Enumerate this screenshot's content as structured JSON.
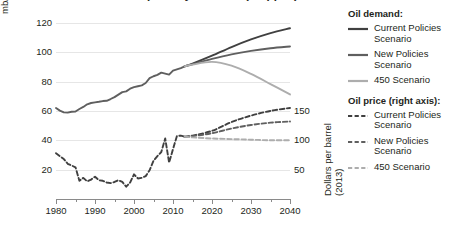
{
  "title": {
    "text": "World oil demand and price by scenario (cropped)",
    "note": "title row is cut off at the top edge of the screenshot"
  },
  "axes": {
    "left": {
      "label": "mb/d",
      "ticks": [
        20,
        40,
        60,
        80,
        100,
        120
      ],
      "min": 0,
      "max": 126
    },
    "right": {
      "label_line1": "Dollars per barrel",
      "label_line2": "(2013)",
      "ticks": [
        50,
        100,
        150
      ],
      "min": 0,
      "max": 315
    },
    "bottom": {
      "ticks": [
        1980,
        1990,
        2000,
        2010,
        2020,
        2030,
        2040
      ],
      "minor_ticks": [
        1985,
        1995,
        2005,
        2015,
        2025,
        2035
      ],
      "min": 1980,
      "max": 2040
    }
  },
  "legend": {
    "groups": [
      {
        "title": "Oil demand:",
        "items": [
          {
            "label": "Current Policies Scenario",
            "style": "solid",
            "color": "#404040"
          },
          {
            "label": "New Policies Scenario",
            "style": "solid",
            "color": "#5f5f5f"
          },
          {
            "label": "450 Scenario",
            "style": "solid",
            "color": "#adadad"
          }
        ]
      },
      {
        "title": "Oil price (right axis):",
        "items": [
          {
            "label": "Current Policies Scenario",
            "style": "dashed",
            "color": "#404040"
          },
          {
            "label": "New Policies Scenario",
            "style": "dashed",
            "color": "#5f5f5f"
          },
          {
            "label": "450 Scenario",
            "style": "dashed",
            "color": "#adadad"
          }
        ]
      }
    ]
  },
  "colors": {
    "current_policies": "#404040",
    "new_policies": "#5f5f5f",
    "scenario_450": "#adadad",
    "gridline": "#e6e6e6",
    "axis": "#8a8a8a",
    "text": "#231f20"
  },
  "chart_data": {
    "type": "line",
    "title": "World oil demand and price by scenario",
    "xlabel": "",
    "ylabel": "mb/d",
    "y2label": "Dollars per barrel (2013)",
    "xlim": [
      1980,
      2040
    ],
    "ylim": [
      0,
      126
    ],
    "y2lim": [
      0,
      315
    ],
    "grid": true,
    "legend_position": "right",
    "note": "Right axis price values equal left-axis units multiplied by 2.5",
    "series": [
      {
        "name": "Oil demand - historical",
        "axis": "left",
        "unit": "mb/d",
        "style": "solid",
        "color": "#5f5f5f",
        "x": [
          1980,
          1981,
          1982,
          1983,
          1984,
          1985,
          1986,
          1987,
          1988,
          1989,
          1990,
          1991,
          1992,
          1993,
          1994,
          1995,
          1996,
          1997,
          1998,
          1999,
          2000,
          2001,
          2002,
          2003,
          2004,
          2005,
          2006,
          2007,
          2008,
          2009,
          2010,
          2011,
          2012,
          2013
        ],
        "y": [
          62.0,
          60.2,
          59.0,
          58.8,
          59.4,
          59.6,
          61.3,
          62.7,
          64.5,
          65.4,
          65.8,
          66.2,
          66.7,
          66.9,
          68.1,
          69.4,
          71.1,
          72.8,
          73.3,
          75.1,
          76.2,
          76.8,
          77.4,
          79.0,
          82.3,
          83.6,
          84.5,
          86.1,
          85.4,
          84.7,
          87.4,
          88.3,
          89.2,
          90.4
        ]
      },
      {
        "name": "Oil demand - Current Policies Scenario",
        "axis": "left",
        "unit": "mb/d",
        "style": "solid",
        "color": "#404040",
        "x": [
          2013,
          2015,
          2020,
          2025,
          2030,
          2035,
          2040
        ],
        "y": [
          90.4,
          92.2,
          97.6,
          103.5,
          108.7,
          113.0,
          116.3
        ]
      },
      {
        "name": "Oil demand - New Policies Scenario",
        "axis": "left",
        "unit": "mb/d",
        "style": "solid",
        "color": "#5f5f5f",
        "x": [
          2013,
          2015,
          2020,
          2025,
          2030,
          2035,
          2040
        ],
        "y": [
          90.4,
          91.8,
          95.4,
          98.5,
          100.9,
          102.7,
          103.9
        ]
      },
      {
        "name": "Oil demand - 450 Scenario",
        "axis": "left",
        "unit": "mb/d",
        "style": "solid",
        "color": "#adadad",
        "x": [
          2013,
          2015,
          2020,
          2025,
          2030,
          2035,
          2040
        ],
        "y": [
          90.4,
          91.5,
          93.4,
          90.8,
          85.2,
          78.3,
          71.2
        ]
      },
      {
        "name": "Oil price - historical",
        "axis": "right",
        "unit": "Dollars per barrel (2013)",
        "style": "dashed",
        "color": "#404040",
        "x": [
          1980,
          1981,
          1982,
          1983,
          1984,
          1985,
          1986,
          1987,
          1988,
          1989,
          1990,
          1991,
          1992,
          1993,
          1994,
          1995,
          1996,
          1997,
          1998,
          1999,
          2000,
          2001,
          2002,
          2003,
          2004,
          2005,
          2006,
          2007,
          2008,
          2009,
          2010,
          2011,
          2012,
          2013
        ],
        "y": [
          78,
          73,
          68,
          60,
          57,
          54,
          31,
          36,
          30,
          33,
          38,
          32,
          31,
          28,
          27,
          29,
          32,
          29,
          21,
          28,
          42,
          35,
          36,
          39,
          49,
          65,
          73,
          80,
          103,
          62,
          85,
          107,
          108,
          106
        ]
      },
      {
        "name": "Oil price - Current Policies Scenario",
        "axis": "right",
        "unit": "Dollars per barrel (2013)",
        "style": "dashed",
        "color": "#404040",
        "x": [
          2013,
          2015,
          2020,
          2025,
          2030,
          2035,
          2040
        ],
        "y": [
          106,
          108,
          116,
          131,
          142,
          150,
          155
        ]
      },
      {
        "name": "Oil price - New Policies Scenario",
        "axis": "right",
        "unit": "Dollars per barrel (2013)",
        "style": "dashed",
        "color": "#5f5f5f",
        "x": [
          2013,
          2015,
          2020,
          2025,
          2030,
          2035,
          2040
        ],
        "y": [
          106,
          107,
          112,
          120,
          126,
          130,
          132
        ]
      },
      {
        "name": "Oil price - 450 Scenario",
        "axis": "right",
        "unit": "Dollars per barrel (2013)",
        "style": "dashed",
        "color": "#adadad",
        "x": [
          2013,
          2015,
          2020,
          2025,
          2030,
          2035,
          2040
        ],
        "y": [
          106,
          105,
          103,
          102,
          101,
          100,
          100
        ]
      }
    ]
  }
}
